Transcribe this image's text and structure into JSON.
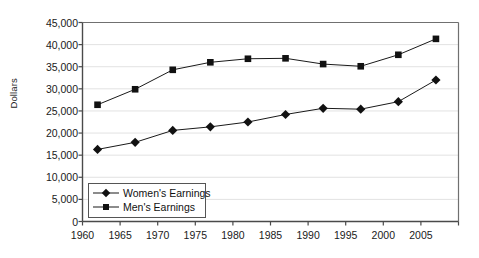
{
  "chart_data": {
    "type": "line",
    "title": "",
    "xlabel": "",
    "ylabel": "Dollars",
    "xlim": [
      1960,
      2010
    ],
    "ylim": [
      0,
      45000
    ],
    "grid": true,
    "legend_position": "inside-lower-left",
    "x": [
      1962,
      1967,
      1972,
      1977,
      1982,
      1987,
      1992,
      1997,
      2002,
      2007
    ],
    "series": [
      {
        "name": "Women's Earnings",
        "marker": "diamond",
        "values": [
          16300,
          17900,
          20600,
          21400,
          22500,
          24200,
          25600,
          25400,
          27100,
          32000
        ]
      },
      {
        "name": "Men's Earnings",
        "marker": "square",
        "values": [
          26400,
          29900,
          34300,
          36000,
          36800,
          36900,
          35600,
          35100,
          37700,
          41300
        ]
      }
    ],
    "y_ticks": [
      0,
      5000,
      10000,
      15000,
      20000,
      25000,
      30000,
      35000,
      40000,
      45000
    ],
    "y_tick_labels": [
      "0",
      "5,000",
      "10,000",
      "15,000",
      "20,000",
      "25,000",
      "30,000",
      "35,000",
      "40,000",
      "45,000"
    ],
    "x_ticks": [
      1960,
      1965,
      1970,
      1975,
      1980,
      1985,
      1990,
      1995,
      2000,
      2005
    ],
    "x_tick_labels": [
      "1960",
      "1965",
      "1970",
      "1975",
      "1980",
      "1985",
      "1990",
      "1995",
      "2000",
      "2005"
    ],
    "colors": {
      "series_line": "#1a1a1a",
      "series_marker": "#111111",
      "gridline": "#e2e2e2",
      "axis": "#707070",
      "text": "#1a1a1a",
      "background": "#ffffff"
    }
  },
  "legend": {
    "items": [
      {
        "label": "Women's Earnings",
        "marker": "diamond"
      },
      {
        "label": "Men's Earnings",
        "marker": "square"
      }
    ]
  }
}
